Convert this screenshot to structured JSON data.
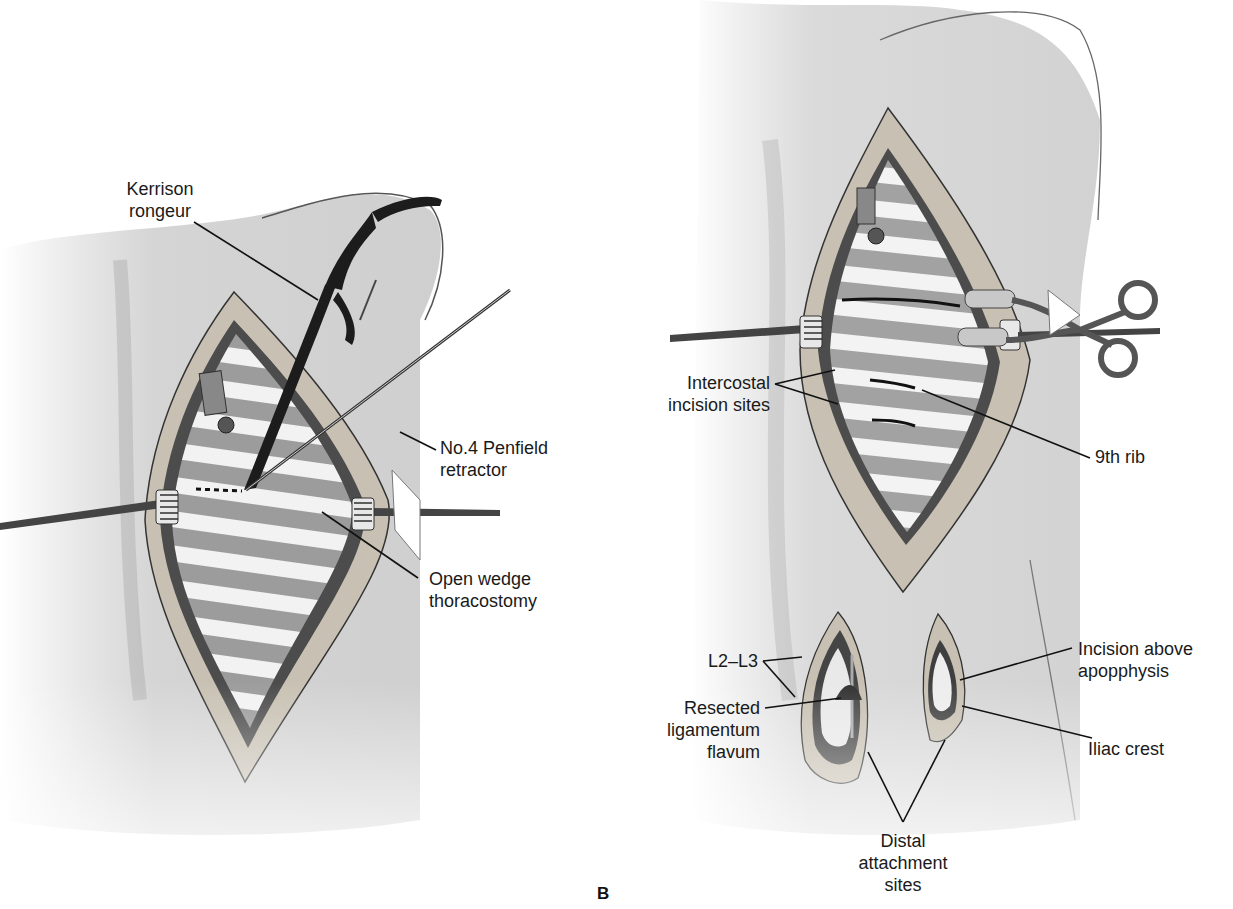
{
  "figure": {
    "panel_letter": "B",
    "left_panel": {
      "labels": [
        {
          "id": "kerrison-rongeur",
          "text": "Kerrison\nrongeur"
        },
        {
          "id": "penfield-retractor",
          "text": "No.4 Penfield\nretractor"
        },
        {
          "id": "open-wedge-thoracostomy",
          "text": "Open wedge\nthoracostomy"
        }
      ]
    },
    "right_panel": {
      "labels": [
        {
          "id": "intercostal-incision-sites",
          "text": "Intercostal\nincision sites"
        },
        {
          "id": "ninth-rib",
          "text": "9th rib"
        },
        {
          "id": "l2-l3",
          "text": "L2–L3"
        },
        {
          "id": "resected-ligamentum-flavum",
          "text": "Resected\nligamentum\nflavum"
        },
        {
          "id": "incision-above-apophysis",
          "text": "Incision above\napopphysis"
        },
        {
          "id": "iliac-crest",
          "text": "Iliac crest"
        },
        {
          "id": "distal-attachment-sites",
          "text": "Distal\nattachment\nsites"
        }
      ]
    },
    "colors": {
      "skin": "#d4d4d4",
      "skin_edge": "#8a8a8a",
      "wound_rim": "#c9c2b4",
      "muscle": "#4a4a4a",
      "rib_light": "#f4f4f4",
      "rib_dark": "#9a9a9a",
      "instrument": "#1e1e1e",
      "leader": "#111111"
    }
  }
}
